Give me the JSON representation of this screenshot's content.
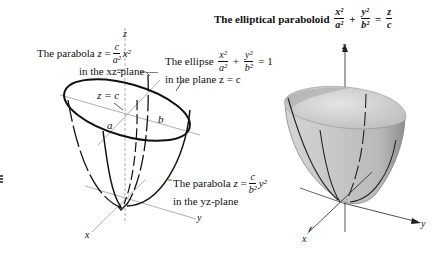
{
  "title": {
    "text": "The elliptical paraboloid",
    "equation": {
      "term1_num": "x²",
      "term1_den": "a²",
      "plus": "+",
      "term2_num": "y²",
      "term2_den": "b²",
      "equals": "=",
      "rhs_num": "z",
      "rhs_den": "c"
    }
  },
  "left_figure": {
    "annotations": {
      "xz_parabola": {
        "prefix": "The parabola",
        "lhs": "z",
        "equals": "=",
        "num": "c",
        "den": "a²",
        "tail": "x²",
        "line2": "in the xz-plane —"
      },
      "ellipse": {
        "prefix": "The ellipse",
        "num1": "x²",
        "den1": "a²",
        "plus": "+",
        "num2": "y²",
        "den2": "b²",
        "rhs": "= 1",
        "line2": "in the plane z = c"
      },
      "plane_label": "z = c",
      "semi_axis_a": "a",
      "semi_axis_b": "b",
      "yz_parabola": {
        "prefix": "The parabola",
        "lhs": "z",
        "equals": "=",
        "num": "c",
        "den": "b²",
        "tail": "y²",
        "line2": "in the yz-plane"
      }
    },
    "axes": {
      "x": "x",
      "y": "y",
      "z": "z"
    }
  },
  "right_figure": {
    "axes": {
      "x": "x",
      "y": "y",
      "z": "z"
    },
    "surface_color": "#c8c8c8"
  },
  "colors": {
    "ink": "#111111",
    "axis": "#9a9a9a",
    "surface_light": "#e2e2e2",
    "surface_dark": "#9c9c9c"
  }
}
